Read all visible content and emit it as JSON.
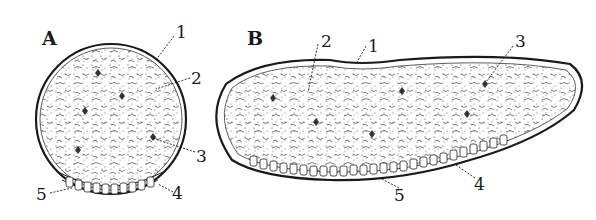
{
  "figure": {
    "panels": [
      {
        "id": "A",
        "label": "A",
        "shape": "circular cross-section",
        "callouts": [
          {
            "n": "1",
            "label": "1"
          },
          {
            "n": "2",
            "label": "2"
          },
          {
            "n": "3",
            "label": "3"
          },
          {
            "n": "4",
            "label": "4"
          },
          {
            "n": "5",
            "label": "5"
          }
        ]
      },
      {
        "id": "B",
        "label": "B",
        "shape": "elongated kidney-shaped cross-section",
        "callouts": [
          {
            "n": "1",
            "label": "1"
          },
          {
            "n": "2",
            "label": "2"
          },
          {
            "n": "3",
            "label": "3"
          },
          {
            "n": "4",
            "label": "4"
          },
          {
            "n": "5",
            "label": "5"
          }
        ]
      }
    ],
    "colors": {
      "ink": "#1a1a1a",
      "background": "#ffffff"
    }
  }
}
